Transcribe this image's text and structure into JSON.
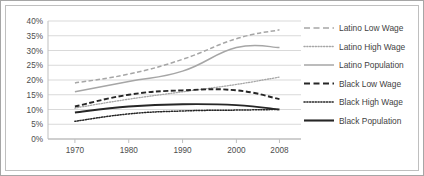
{
  "chart_data": {
    "type": "line",
    "title": "",
    "xlabel": "",
    "ylabel": "",
    "x": [
      1970,
      1980,
      1990,
      2000,
      2008
    ],
    "categories": [
      "1970",
      "1980",
      "1990",
      "2000",
      "2008"
    ],
    "xtick_labels": [
      "1970",
      "1980",
      "1990",
      "2000",
      "2008"
    ],
    "ytick_labels": [
      "0%",
      "5%",
      "10%",
      "15%",
      "20%",
      "25%",
      "30%",
      "35%",
      "40%"
    ],
    "ytick_values": [
      0,
      5,
      10,
      15,
      20,
      25,
      30,
      35,
      40
    ],
    "ylim": [
      0,
      40
    ],
    "xlim": [
      1965,
      2012
    ],
    "grid": "horizontal",
    "legend_position": "right",
    "series": [
      {
        "name": "Latino Low Wage",
        "style": "dashed",
        "color": "#a6a6a6",
        "values": [
          19.0,
          22.0,
          27.0,
          34.0,
          37.0
        ]
      },
      {
        "name": "Latino High Wage",
        "style": "dotted",
        "color": "#a6a6a6",
        "values": [
          10.5,
          13.5,
          16.0,
          18.5,
          21.0
        ]
      },
      {
        "name": "Latino Population",
        "style": "solid",
        "color": "#a6a6a6",
        "values": [
          16.0,
          19.5,
          23.0,
          31.0,
          31.0
        ]
      },
      {
        "name": "Black Low Wage",
        "style": "dashed",
        "color": "#262626",
        "values": [
          11.0,
          15.0,
          16.5,
          16.5,
          13.5
        ]
      },
      {
        "name": "Black High Wage",
        "style": "dotted",
        "color": "#262626",
        "values": [
          6.0,
          8.5,
          9.5,
          9.8,
          10.0
        ]
      },
      {
        "name": "Black Population",
        "style": "solid",
        "color": "#262626",
        "values": [
          9.0,
          11.0,
          11.8,
          11.5,
          10.0
        ]
      }
    ],
    "legend_entries": [
      {
        "label": "Latino Low Wage",
        "style": "dashed",
        "color": "#a6a6a6"
      },
      {
        "label": "Latino High Wage",
        "style": "dotted",
        "color": "#a6a6a6"
      },
      {
        "label": "Latino Population",
        "style": "solid",
        "color": "#a6a6a6"
      },
      {
        "label": "Black Low Wage",
        "style": "dashed",
        "color": "#262626"
      },
      {
        "label": "Black High Wage",
        "style": "dotted",
        "color": "#262626"
      },
      {
        "label": "Black Population",
        "style": "solid",
        "color": "#262626"
      }
    ],
    "colors": {
      "latino": "#a6a6a6",
      "black": "#262626",
      "grid": "#d9d9d9",
      "axis": "#bfbfbf",
      "border": "#a6a6a6",
      "text": "#4d4d4d",
      "background": "#ffffff"
    }
  }
}
